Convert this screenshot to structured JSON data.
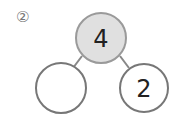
{
  "problem": {
    "label": "②"
  },
  "number_bond": {
    "whole": {
      "value": "4",
      "fill": "#e0e0e0",
      "stroke": "#9a9a9a"
    },
    "parts": [
      {
        "value": "",
        "fill": "#ffffff",
        "stroke": "#777777"
      },
      {
        "value": "2",
        "fill": "#ffffff",
        "stroke": "#777777"
      }
    ]
  }
}
